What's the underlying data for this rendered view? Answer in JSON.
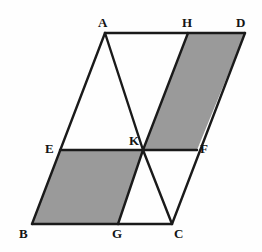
{
  "figure": {
    "kind": "geometry-diagram",
    "canvas": {
      "width": 262,
      "height": 252
    },
    "colors": {
      "background": "#fefefe",
      "stroke": "#1a1a1a",
      "shaded_fill": "#9a9a9a",
      "unshaded_fill": "#ffffff",
      "label": "#141414"
    },
    "stroke_width": 2.4,
    "points": {
      "A": {
        "label": "A",
        "x": 105,
        "y": 33,
        "label_x": 98,
        "label_y": 16
      },
      "B": {
        "label": "B",
        "x": 32,
        "y": 224,
        "label_x": 19,
        "label_y": 227
      },
      "C": {
        "label": "C",
        "x": 172,
        "y": 224,
        "label_x": 174,
        "label_y": 227
      },
      "D": {
        "label": "D",
        "x": 245,
        "y": 33,
        "label_x": 236,
        "label_y": 16
      },
      "E": {
        "label": "E",
        "x": 60,
        "y": 150,
        "label_x": 45,
        "label_y": 142
      },
      "F": {
        "label": "F",
        "x": 197,
        "y": 150,
        "label_x": 200,
        "label_y": 142
      },
      "G": {
        "label": "G",
        "x": 118,
        "y": 224,
        "label_x": 112,
        "label_y": 227
      },
      "H": {
        "label": "H",
        "x": 188,
        "y": 33,
        "label_x": 182,
        "label_y": 16
      },
      "K": {
        "label": "K",
        "x": 143,
        "y": 150,
        "label_x": 129,
        "label_y": 134
      }
    },
    "shaded_regions": [
      {
        "name": "lower-left-shaded-parallelogram",
        "vertices": "E,K,G,B"
      },
      {
        "name": "upper-right-shaded-parallelogram",
        "vertices": "K,H,D,F"
      }
    ],
    "segments": [
      {
        "name": "segment-AD",
        "from": "A",
        "to": "D"
      },
      {
        "name": "segment-BC",
        "from": "B",
        "to": "C"
      },
      {
        "name": "segment-AB",
        "from": "A",
        "to": "B"
      },
      {
        "name": "segment-DC",
        "from": "D",
        "to": "C"
      },
      {
        "name": "segment-EF",
        "from": "E",
        "to": "F"
      },
      {
        "name": "segment-AK",
        "from": "A",
        "to": "K"
      },
      {
        "name": "segment-KH",
        "from": "K",
        "to": "H"
      },
      {
        "name": "segment-KG",
        "from": "K",
        "to": "G"
      },
      {
        "name": "segment-KC",
        "from": "K",
        "to": "C"
      }
    ]
  }
}
